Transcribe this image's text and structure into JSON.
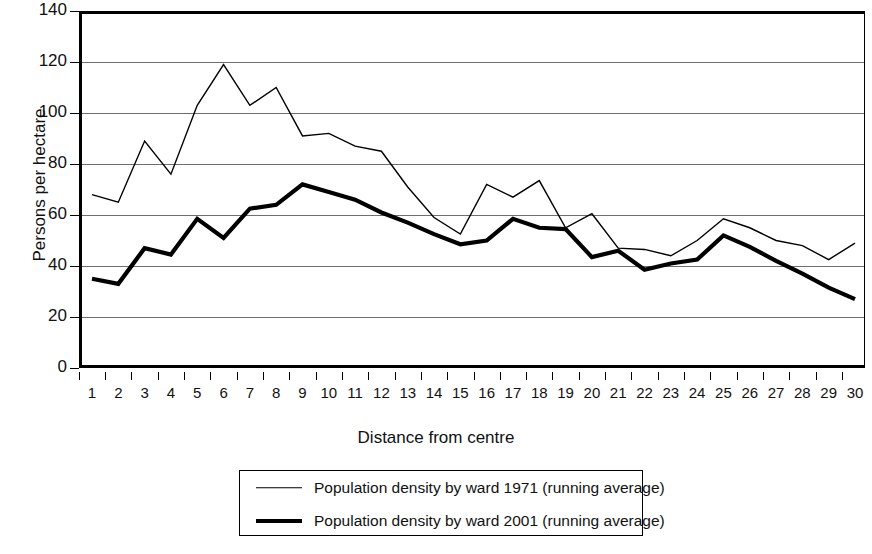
{
  "chart_data": {
    "type": "line",
    "title": "",
    "xlabel": "Distance from centre",
    "ylabel": "Persons per hectare",
    "xlim": [
      1,
      30
    ],
    "ylim": [
      0,
      140
    ],
    "ytick_step": 20,
    "yticks": [
      0,
      20,
      40,
      60,
      80,
      100,
      120,
      140
    ],
    "categories": [
      1,
      2,
      3,
      4,
      5,
      6,
      7,
      8,
      9,
      10,
      11,
      12,
      13,
      14,
      15,
      16,
      17,
      18,
      19,
      20,
      21,
      22,
      23,
      24,
      25,
      26,
      27,
      28,
      29,
      30
    ],
    "grid": "horizontal",
    "legend_position": "below",
    "series": [
      {
        "name": "Population density by ward 1971 (running average)",
        "style": "thin",
        "color": "#000000",
        "values": [
          68,
          65,
          89,
          76,
          103,
          119,
          103,
          110,
          91,
          92,
          87,
          85,
          71,
          59,
          52.5,
          72,
          67,
          73.5,
          55,
          60.5,
          47,
          46.5,
          44,
          50,
          58.5,
          55,
          50,
          48,
          42.5,
          49
        ]
      },
      {
        "name": "Population density by ward 2001 (running average)",
        "style": "thick",
        "color": "#000000",
        "values": [
          35,
          33,
          47,
          44.5,
          58.5,
          51,
          62.5,
          64,
          72,
          69,
          66,
          61,
          57,
          52.5,
          48.5,
          50,
          58.5,
          55,
          54.5,
          43.5,
          46,
          38.5,
          41,
          42.5,
          52,
          47.5,
          42,
          37,
          31.5,
          27
        ]
      }
    ]
  },
  "legend": {
    "items": [
      {
        "label": "Population density by ward 1971 (running average)",
        "style": "thin"
      },
      {
        "label": "Population density by ward 2001 (running average)",
        "style": "thick"
      }
    ]
  }
}
